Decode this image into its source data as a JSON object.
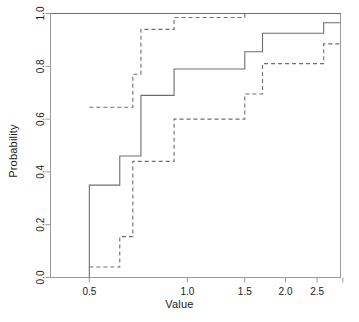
{
  "chart_data": {
    "type": "line",
    "title": "",
    "subtitle": "",
    "xlabel": "Value",
    "ylabel": "Probability",
    "xscale": "log",
    "yscale": "linear",
    "xlim": [
      0.38,
      2.95
    ],
    "ylim": [
      0.0,
      1.0
    ],
    "grid": false,
    "legend": null,
    "xticks": [
      0.5,
      1.0,
      1.5,
      2.0,
      2.5
    ],
    "xtick_labels": [
      "0.5",
      "1.0",
      "1.5",
      "2.0",
      "2.5"
    ],
    "xticks_unlabeled": [
      3.0
    ],
    "yticks": [
      0.0,
      0.2,
      0.4,
      0.6,
      0.8,
      1.0
    ],
    "ytick_labels": [
      "0.0",
      "0.2",
      "0.4",
      "0.6",
      "0.8",
      "1.0"
    ],
    "annotations": [],
    "series": [
      {
        "name": "upper-solid",
        "style": "solid",
        "drawstyle": "steps-post",
        "color": "#6e6e6e",
        "x": [
          0.38,
          2.95
        ],
        "y": [
          1.0,
          1.0
        ]
      },
      {
        "name": "middle-solid",
        "style": "solid",
        "drawstyle": "steps-post",
        "color": "#6e6e6e",
        "x": [
          0.5,
          0.5,
          0.62,
          0.72,
          0.91,
          1.5,
          1.7,
          2.62,
          2.8,
          2.95
        ],
        "y": [
          0.0,
          0.35,
          0.46,
          0.69,
          0.79,
          0.855,
          0.925,
          0.965,
          0.965,
          0.965
        ]
      },
      {
        "name": "lower-dashed",
        "style": "dashed",
        "drawstyle": "steps-post",
        "color": "#6e6e6e",
        "x": [
          0.5,
          0.62,
          0.68,
          0.72,
          0.91,
          1.5,
          1.7,
          2.62,
          2.8,
          2.95
        ],
        "y": [
          0.04,
          0.155,
          0.44,
          0.44,
          0.6,
          0.695,
          0.81,
          0.885,
          0.885,
          0.885
        ]
      },
      {
        "name": "upper-dashed",
        "style": "dashed",
        "drawstyle": "steps-post",
        "color": "#6e6e6e",
        "x": [
          0.5,
          0.62,
          0.68,
          0.72,
          0.91,
          1.5,
          2.95
        ],
        "y": [
          0.645,
          0.645,
          0.77,
          0.94,
          0.985,
          1.0,
          1.0
        ]
      }
    ]
  },
  "figure": {
    "xlabel": "Value",
    "ylabel": "Probability"
  }
}
